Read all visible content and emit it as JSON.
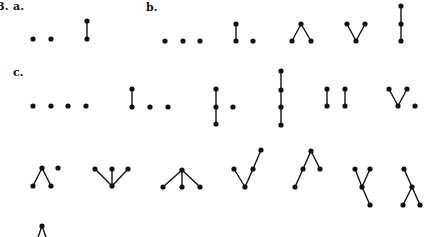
{
  "figure": {
    "title_label": "3.",
    "colors": {
      "ink": "#111111",
      "background": "#ffffff"
    },
    "node_radius": 2.6,
    "edge_width": 1.4
  },
  "labels": [
    {
      "id": "fig-number",
      "text": "3.",
      "x": -3,
      "y": 1
    },
    {
      "id": "part-a",
      "text": "a.",
      "x": 13,
      "y": 1
    },
    {
      "id": "part-b",
      "text": "b.",
      "x": 146,
      "y": 2
    },
    {
      "id": "part-c",
      "text": "c.",
      "x": 13,
      "y": 67
    }
  ],
  "graphs": [
    {
      "part": "a",
      "name": "empty-2",
      "nodes": [
        [
          33,
          39
        ],
        [
          51,
          39
        ]
      ],
      "edges": []
    },
    {
      "part": "a",
      "name": "edge-2",
      "nodes": [
        [
          87,
          21
        ],
        [
          87,
          39
        ]
      ],
      "edges": [
        [
          0,
          1
        ]
      ]
    },
    {
      "part": "b",
      "name": "empty-3",
      "nodes": [
        [
          165,
          41
        ],
        [
          183,
          41
        ],
        [
          200,
          41
        ]
      ],
      "edges": []
    },
    {
      "part": "b",
      "name": "edge-plus-point",
      "nodes": [
        [
          236,
          24
        ],
        [
          236,
          41
        ],
        [
          253,
          41
        ]
      ],
      "edges": [
        [
          0,
          1
        ]
      ]
    },
    {
      "part": "b",
      "name": "lambda",
      "nodes": [
        [
          301,
          24
        ],
        [
          292,
          41
        ],
        [
          311,
          41
        ]
      ],
      "edges": [
        [
          0,
          1
        ],
        [
          0,
          2
        ]
      ]
    },
    {
      "part": "b",
      "name": "vee",
      "nodes": [
        [
          347,
          24
        ],
        [
          365,
          24
        ],
        [
          356,
          41
        ]
      ],
      "edges": [
        [
          0,
          2
        ],
        [
          1,
          2
        ]
      ]
    },
    {
      "part": "b",
      "name": "chain-3",
      "nodes": [
        [
          401,
          6
        ],
        [
          401,
          24
        ],
        [
          401,
          41
        ]
      ],
      "edges": [
        [
          0,
          1
        ],
        [
          1,
          2
        ]
      ]
    },
    {
      "part": "c",
      "name": "empty-4",
      "nodes": [
        [
          33,
          106
        ],
        [
          51,
          106
        ],
        [
          68,
          106
        ],
        [
          86,
          106
        ]
      ],
      "edges": []
    },
    {
      "part": "c",
      "name": "edge-plus-2-points",
      "nodes": [
        [
          132,
          89
        ],
        [
          132,
          107
        ],
        [
          150,
          107
        ],
        [
          168,
          107
        ]
      ],
      "edges": [
        [
          0,
          1
        ]
      ]
    },
    {
      "part": "c",
      "name": "chain-3-plus-point",
      "nodes": [
        [
          216,
          89
        ],
        [
          216,
          107
        ],
        [
          216,
          124
        ],
        [
          233,
          107
        ]
      ],
      "edges": [
        [
          0,
          1
        ],
        [
          1,
          2
        ]
      ]
    },
    {
      "part": "c",
      "name": "chain-4",
      "nodes": [
        [
          281,
          71
        ],
        [
          281,
          90
        ],
        [
          281,
          107
        ],
        [
          281,
          125
        ]
      ],
      "edges": [
        [
          0,
          1
        ],
        [
          1,
          2
        ],
        [
          2,
          3
        ]
      ]
    },
    {
      "part": "c",
      "name": "two-edges",
      "nodes": [
        [
          327,
          89
        ],
        [
          327,
          106
        ],
        [
          345,
          89
        ],
        [
          345,
          106
        ]
      ],
      "edges": [
        [
          0,
          1
        ],
        [
          2,
          3
        ]
      ]
    },
    {
      "part": "c",
      "name": "vee-plus-point",
      "nodes": [
        [
          389,
          89
        ],
        [
          407,
          89
        ],
        [
          398,
          106
        ],
        [
          415,
          106
        ]
      ],
      "edges": [
        [
          0,
          2
        ],
        [
          1,
          2
        ]
      ]
    },
    {
      "part": "c",
      "name": "lambda-plus-point",
      "nodes": [
        [
          42,
          168
        ],
        [
          33,
          186
        ],
        [
          51,
          186
        ],
        [
          58,
          168
        ]
      ],
      "edges": [
        [
          0,
          1
        ],
        [
          0,
          2
        ]
      ]
    },
    {
      "part": "c",
      "name": "claw-down",
      "nodes": [
        [
          95,
          169
        ],
        [
          112,
          169
        ],
        [
          128,
          169
        ],
        [
          112,
          186
        ]
      ],
      "edges": [
        [
          0,
          3
        ],
        [
          1,
          3
        ],
        [
          2,
          3
        ]
      ]
    },
    {
      "part": "c",
      "name": "claw-up",
      "nodes": [
        [
          182,
          170
        ],
        [
          163,
          187
        ],
        [
          182,
          187
        ],
        [
          200,
          187
        ]
      ],
      "edges": [
        [
          0,
          1
        ],
        [
          0,
          2
        ],
        [
          0,
          3
        ]
      ]
    },
    {
      "part": "c",
      "name": "check-shape",
      "nodes": [
        [
          234,
          169
        ],
        [
          245,
          187
        ],
        [
          253,
          169
        ],
        [
          261,
          150
        ]
      ],
      "edges": [
        [
          0,
          1
        ],
        [
          1,
          2
        ],
        [
          2,
          3
        ]
      ]
    },
    {
      "part": "c",
      "name": "n-shape",
      "nodes": [
        [
          295,
          187
        ],
        [
          303,
          169
        ],
        [
          311,
          151
        ],
        [
          320,
          169
        ]
      ],
      "edges": [
        [
          0,
          1
        ],
        [
          1,
          2
        ],
        [
          2,
          3
        ]
      ]
    },
    {
      "part": "c",
      "name": "y-shape",
      "nodes": [
        [
          355,
          169
        ],
        [
          370,
          169
        ],
        [
          362,
          187
        ],
        [
          370,
          205
        ]
      ],
      "edges": [
        [
          0,
          2
        ],
        [
          1,
          2
        ],
        [
          2,
          3
        ]
      ]
    },
    {
      "part": "c",
      "name": "inverted-y-shape",
      "nodes": [
        [
          404,
          169
        ],
        [
          412,
          187
        ],
        [
          403,
          205
        ],
        [
          420,
          205
        ]
      ],
      "edges": [
        [
          0,
          1
        ],
        [
          1,
          2
        ],
        [
          1,
          3
        ]
      ]
    },
    {
      "part": "c",
      "name": "partial-lambda-clipped",
      "nodes": [
        [
          42,
          226
        ]
      ],
      "edges": [],
      "stubs": [
        [
          [
            42,
            226
          ],
          [
            37,
            240
          ]
        ],
        [
          [
            42,
            226
          ],
          [
            47,
            240
          ]
        ]
      ]
    }
  ]
}
